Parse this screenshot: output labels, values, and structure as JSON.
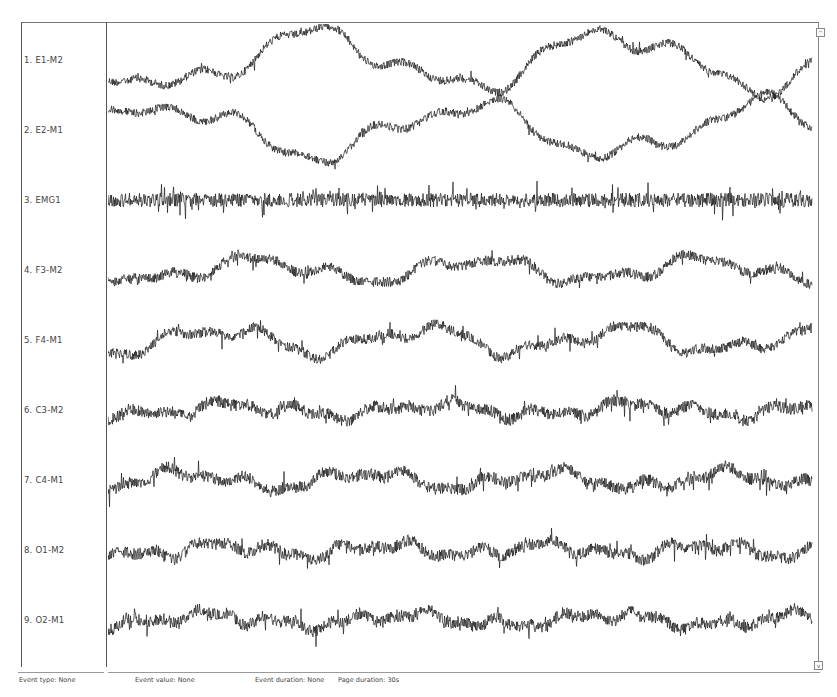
{
  "channels": [
    {
      "index": 1,
      "label": "1. E1-M2",
      "y": 60
    },
    {
      "index": 2,
      "label": "2. E2-M1",
      "y": 130
    },
    {
      "index": 3,
      "label": "3. EMG1",
      "y": 200
    },
    {
      "index": 4,
      "label": "4. F3-M2",
      "y": 270
    },
    {
      "index": 5,
      "label": "5. F4-M1",
      "y": 340
    },
    {
      "index": 6,
      "label": "6. C3-M2",
      "y": 410
    },
    {
      "index": 7,
      "label": "7. C4-M1",
      "y": 480
    },
    {
      "index": 8,
      "label": "8. O1-M2",
      "y": 550
    },
    {
      "index": 9,
      "label": "9. O2-M1",
      "y": 620
    }
  ],
  "status_bar": {
    "event_type": "Event type: None",
    "event_value": "Event value: None",
    "event_duration": "Event duration: None",
    "page_duration": "Page duration: 30s"
  },
  "scroll": {
    "up_glyph": "^",
    "down_glyph": "v"
  },
  "colors": {
    "trace": "#1a1a1a",
    "border": "#666666",
    "background": "#ffffff"
  }
}
